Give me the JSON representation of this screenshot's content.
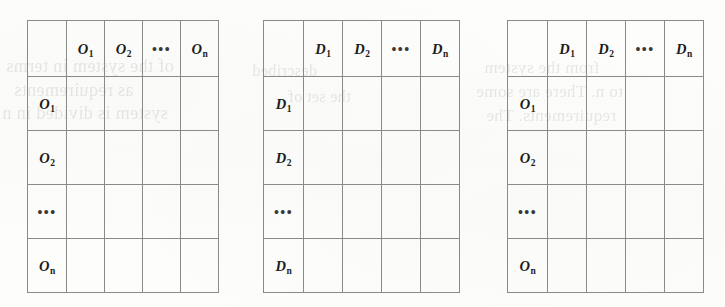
{
  "figure": {
    "kind": "matrix-grid-diagram",
    "background_color": "#fdfdfc",
    "grid_line_color": "#8a8a88",
    "label_color": "#1d1c1a",
    "ellipsis": "•••",
    "blank_cell": ""
  },
  "ghost_text": [
    {
      "text": "of the system in terms",
      "left": 6,
      "top": 56,
      "size": 18
    },
    {
      "text": "as requirements",
      "left": 14,
      "top": 80,
      "size": 18
    },
    {
      "text": "system is divided in n",
      "left": 2,
      "top": 103,
      "size": 18
    },
    {
      "text": "described",
      "left": 252,
      "top": 62,
      "size": 16
    },
    {
      "text": "the set of",
      "left": 288,
      "top": 88,
      "size": 16
    },
    {
      "text": "from the system",
      "left": 484,
      "top": 58,
      "size": 17
    },
    {
      "text": "to n. There are some",
      "left": 476,
      "top": 82,
      "size": 17
    },
    {
      "text": "requirements. The",
      "left": 486,
      "top": 106,
      "size": 17
    }
  ],
  "tables": [
    {
      "id": "matrix-oo",
      "name": "objects-vs-objects-matrix",
      "left": 27,
      "top": 20,
      "width": 192,
      "height": 271,
      "column_headers": [
        "",
        "O1",
        "O2",
        "...",
        "On"
      ],
      "column_headers_display": [
        {
          "base": "",
          "sub": ""
        },
        {
          "base": "O",
          "sub": "1"
        },
        {
          "base": "O",
          "sub": "2"
        },
        {
          "base": "•••",
          "sub": ""
        },
        {
          "base": "O",
          "sub": "n"
        }
      ],
      "row_headers": [
        "O1",
        "O2",
        "...",
        "On"
      ],
      "row_headers_display": [
        {
          "base": "O",
          "sub": "1"
        },
        {
          "base": "O",
          "sub": "2"
        },
        {
          "base": "•••",
          "sub": ""
        },
        {
          "base": "O",
          "sub": "n"
        }
      ],
      "cells": [
        [
          "",
          "",
          "",
          ""
        ],
        [
          "",
          "",
          "",
          ""
        ],
        [
          "",
          "",
          "",
          ""
        ],
        [
          "",
          "",
          "",
          ""
        ]
      ]
    },
    {
      "id": "matrix-dd",
      "name": "dependencies-vs-dependencies-matrix",
      "left": 263,
      "top": 20,
      "width": 195,
      "height": 271,
      "column_headers": [
        "",
        "D1",
        "D2",
        "...",
        "Dn"
      ],
      "column_headers_display": [
        {
          "base": "",
          "sub": ""
        },
        {
          "base": "D",
          "sub": "1"
        },
        {
          "base": "D",
          "sub": "2"
        },
        {
          "base": "•••",
          "sub": ""
        },
        {
          "base": "D",
          "sub": "n"
        }
      ],
      "row_headers": [
        "D1",
        "D2",
        "...",
        "Dn"
      ],
      "row_headers_display": [
        {
          "base": "D",
          "sub": "1"
        },
        {
          "base": "D",
          "sub": "2"
        },
        {
          "base": "•••",
          "sub": ""
        },
        {
          "base": "D",
          "sub": "n"
        }
      ],
      "cells": [
        [
          "",
          "",
          "",
          ""
        ],
        [
          "",
          "",
          "",
          ""
        ],
        [
          "",
          "",
          "",
          ""
        ],
        [
          "",
          "",
          "",
          ""
        ]
      ]
    },
    {
      "id": "matrix-od",
      "name": "objects-vs-dependencies-matrix",
      "left": 507,
      "top": 20,
      "width": 194,
      "height": 271,
      "column_headers": [
        "",
        "D1",
        "D2",
        "...",
        "Dn"
      ],
      "column_headers_display": [
        {
          "base": "",
          "sub": ""
        },
        {
          "base": "D",
          "sub": "1"
        },
        {
          "base": "D",
          "sub": "2"
        },
        {
          "base": "•••",
          "sub": ""
        },
        {
          "base": "D",
          "sub": "n"
        }
      ],
      "row_headers": [
        "O1",
        "O2",
        "...",
        "On"
      ],
      "row_headers_display": [
        {
          "base": "O",
          "sub": "1"
        },
        {
          "base": "O",
          "sub": "2"
        },
        {
          "base": "•••",
          "sub": ""
        },
        {
          "base": "O",
          "sub": "n"
        }
      ],
      "cells": [
        [
          "",
          "",
          "",
          ""
        ],
        [
          "",
          "",
          "",
          ""
        ],
        [
          "",
          "",
          "",
          ""
        ],
        [
          "",
          "",
          "",
          ""
        ]
      ]
    }
  ]
}
